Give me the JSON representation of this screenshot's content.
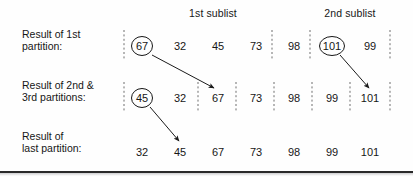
{
  "figure": {
    "width": 413,
    "height": 177,
    "background_color": "#fefefe",
    "ink_color": "#161616",
    "separator_color": "#6e6e6e",
    "rule_color": "#2a2a2a"
  },
  "headers": [
    {
      "label": "1st sublist",
      "x": 213,
      "y": 13
    },
    {
      "label": "2nd sublist",
      "x": 350,
      "y": 13
    }
  ],
  "rows": [
    {
      "id": "row-first-partition",
      "label_line1": "Result of 1st",
      "label_line2": "partition:",
      "label_x": 22,
      "label_y": 40,
      "cell_y": 46,
      "values": [
        "67",
        "32",
        "45",
        "73",
        "98",
        "101",
        "99"
      ],
      "circled": [
        0,
        5
      ],
      "separators_x": [
        124,
        272,
        310,
        390
      ]
    },
    {
      "id": "row-second-third-partitions",
      "label_line1": "Result of 2nd &",
      "label_line2": "3rd partitions:",
      "label_x": 22,
      "label_y": 91,
      "cell_y": 98,
      "values": [
        "45",
        "32",
        "67",
        "73",
        "98",
        "99",
        "101"
      ],
      "circled": [
        0
      ],
      "separators_x": [
        124,
        198,
        236,
        274,
        312,
        350,
        390
      ]
    },
    {
      "id": "row-last-partition",
      "label_line1": "Result of",
      "label_line2": "last partition:",
      "label_x": 22,
      "label_y": 142,
      "cell_y": 152,
      "values": [
        "32",
        "45",
        "67",
        "73",
        "98",
        "99",
        "101"
      ],
      "circled": [],
      "separators_x": []
    }
  ],
  "columns_x": [
    142,
    180,
    218,
    256,
    294,
    332,
    370
  ],
  "arrows": [
    {
      "id": "arrow-67-moves",
      "x1": 152,
      "y1": 55,
      "x2": 214,
      "y2": 88
    },
    {
      "id": "arrow-101-moves",
      "x1": 340,
      "y1": 55,
      "x2": 369,
      "y2": 88
    },
    {
      "id": "arrow-45-moves",
      "x1": 150,
      "y1": 107,
      "x2": 179,
      "y2": 141
    }
  ],
  "bottom_rule": {
    "y": 171
  }
}
